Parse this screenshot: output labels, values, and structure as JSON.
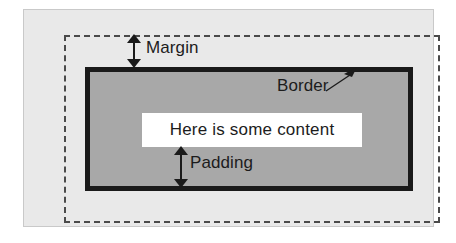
{
  "diagram": {
    "type": "box-model-diagram",
    "content_text": "Here is some content",
    "labels": {
      "margin": "Margin",
      "border": "Border",
      "padding": "Padding"
    },
    "colors": {
      "page_background": "#ffffff",
      "margin_area_fill": "#e9e9e9",
      "margin_area_stroke": "#c9c9c9",
      "margin_dashed_stroke": "#4a4a4a",
      "border_stroke": "#1a1a1a",
      "padding_fill": "#a8a8a8",
      "content_fill": "#ffffff",
      "text": "#1c1c1c"
    },
    "regions": [
      {
        "name": "margin",
        "label": "Margin",
        "fill": "#e9e9e9",
        "edge_style": "dashed"
      },
      {
        "name": "border",
        "label": "Border",
        "fill": "#1a1a1a",
        "edge_style": "solid"
      },
      {
        "name": "padding",
        "label": "Padding",
        "fill": "#a8a8a8",
        "edge_style": "none"
      },
      {
        "name": "content",
        "label": "Here is some content",
        "fill": "#ffffff",
        "edge_style": "none"
      }
    ]
  }
}
